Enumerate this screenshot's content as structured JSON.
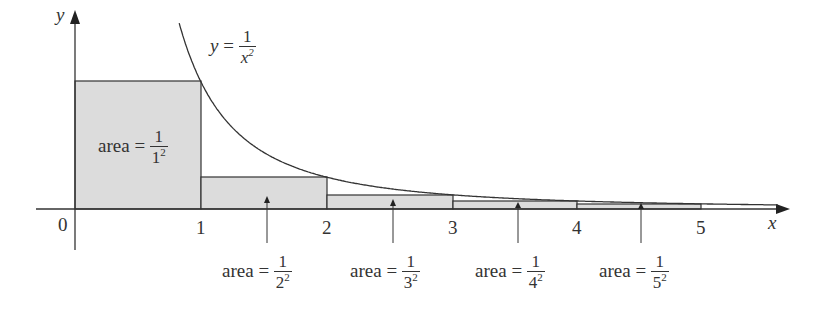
{
  "chart_data": {
    "type": "area",
    "title": "",
    "xlabel": "x",
    "ylabel": "y",
    "x_ticks": [
      "0",
      "1",
      "2",
      "3",
      "4",
      "5"
    ],
    "curve": {
      "label_lhs": "y =",
      "label_num": "1",
      "label_den": "x",
      "label_den_exp": "2",
      "function": "1/x^2"
    },
    "rectangles": [
      {
        "x0": 0,
        "x1": 1,
        "height": 1,
        "label_prefix": "area =",
        "num": "1",
        "den": "1",
        "exp": "2"
      },
      {
        "x0": 1,
        "x1": 2,
        "height": 0.25,
        "label_prefix": "area =",
        "num": "1",
        "den": "2",
        "exp": "2"
      },
      {
        "x0": 2,
        "x1": 3,
        "height": 0.1111,
        "label_prefix": "area =",
        "num": "1",
        "den": "3",
        "exp": "2"
      },
      {
        "x0": 3,
        "x1": 4,
        "height": 0.0625,
        "label_prefix": "area =",
        "num": "1",
        "den": "4",
        "exp": "2"
      },
      {
        "x0": 4,
        "x1": 5,
        "height": 0.04,
        "label_prefix": "area =",
        "num": "1",
        "den": "5",
        "exp": "2"
      }
    ],
    "xlim": [
      0,
      5.6
    ],
    "ylim": [
      0,
      1.4
    ],
    "grid": false
  }
}
